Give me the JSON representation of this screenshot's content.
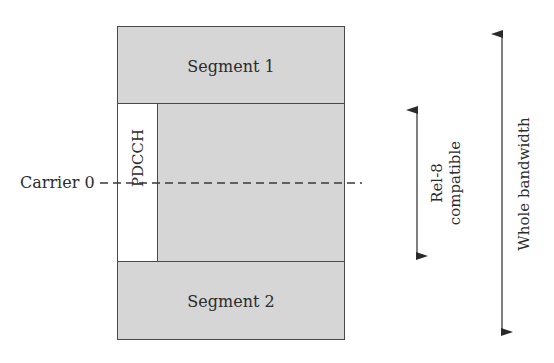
{
  "diagram": {
    "segments": [
      {
        "id": "segment-1",
        "label": "Segment 1"
      },
      {
        "id": "segment-2",
        "label": "Segment 2"
      }
    ],
    "control_channel": {
      "label": "PDCCH"
    },
    "carrier": {
      "label": "Carrier 0"
    },
    "arrows": [
      {
        "id": "rel8",
        "line1": "Rel-8",
        "line2": "compatible"
      },
      {
        "id": "whole",
        "label": "Whole bandwidth"
      }
    ],
    "colors": {
      "segment_fill": "#d6d6d6",
      "pdcch_fill": "#ffffff",
      "stroke": "#4a4a4a"
    }
  }
}
